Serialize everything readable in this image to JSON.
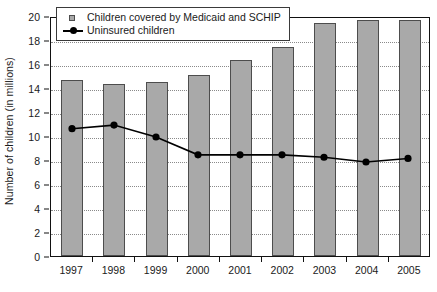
{
  "chart_data": {
    "type": "bar",
    "title": "",
    "xlabel": "",
    "ylabel": "Number of children (in millions)",
    "categories": [
      "1997",
      "1998",
      "1999",
      "2000",
      "2001",
      "2002",
      "2003",
      "2004",
      "2005"
    ],
    "ylim": [
      0,
      20
    ],
    "yticks": [
      0,
      2,
      4,
      6,
      8,
      10,
      12,
      14,
      16,
      18,
      20
    ],
    "ytick_labels": [
      "0",
      "2",
      "4",
      "6",
      "8",
      "10",
      "12",
      "14",
      "16",
      "18",
      "20"
    ],
    "grid": true,
    "grid_axis": "y",
    "grid_style": "dotted",
    "legend_position": "upper left",
    "series": [
      {
        "name": "Children covered by Medicaid and SCHIP",
        "type": "bar",
        "color": "#a9a9a9",
        "edge_color": "#4d4d4d",
        "values": [
          14.7,
          14.3,
          14.5,
          15.1,
          16.3,
          17.4,
          19.4,
          19.7,
          19.7
        ]
      },
      {
        "name": "Uninsured children",
        "type": "line",
        "color": "#000000",
        "marker": "circle",
        "values": [
          10.7,
          11.0,
          10.0,
          8.5,
          8.5,
          8.5,
          8.3,
          7.9,
          8.2
        ]
      }
    ]
  },
  "legend": {
    "items": [
      {
        "label": "Children covered by Medicaid and SCHIP",
        "marker": "square"
      },
      {
        "label": "Uninsured children",
        "marker": "line-dot"
      }
    ]
  },
  "colors": {
    "bar_fill": "#a9a9a9",
    "bar_edge": "#4d4d4d",
    "line": "#000000",
    "axis": "#111111",
    "grid": "#8a8a8a",
    "background": "#ffffff"
  }
}
